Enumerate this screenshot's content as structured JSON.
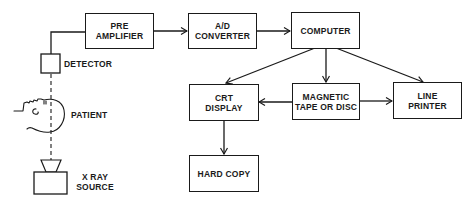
{
  "diagram": {
    "type": "block-diagram",
    "components": {
      "preamp": {
        "lines": [
          "PRE",
          "AMPLIFIER"
        ]
      },
      "adc": {
        "lines": [
          "A/D",
          "CONVERTER"
        ]
      },
      "computer": {
        "lines": [
          "COMPUTER"
        ]
      },
      "crt": {
        "lines": [
          "CRT",
          "DISPLAY"
        ]
      },
      "magnetic": {
        "lines": [
          "MAGNETIC",
          "TAPE OR DISC"
        ]
      },
      "printer": {
        "lines": [
          "LINE",
          "PRINTER"
        ]
      },
      "hardcopy": {
        "lines": [
          "HARD COPY"
        ]
      }
    },
    "labels": {
      "detector": "DETECTOR",
      "patient": "PATIENT",
      "xray_line1": "X RAY",
      "xray_line2": "SOURCE"
    },
    "connections": [
      {
        "from": "detector",
        "to": "preamp",
        "style": "solid"
      },
      {
        "from": "preamp",
        "to": "adc",
        "style": "arrow"
      },
      {
        "from": "adc",
        "to": "computer",
        "style": "arrow"
      },
      {
        "from": "computer",
        "to": "crt",
        "style": "arrow"
      },
      {
        "from": "computer",
        "to": "magnetic",
        "style": "arrow"
      },
      {
        "from": "computer",
        "to": "printer",
        "style": "arrow"
      },
      {
        "from": "magnetic",
        "to": "crt",
        "style": "arrow"
      },
      {
        "from": "magnetic",
        "to": "printer",
        "style": "arrow"
      },
      {
        "from": "crt",
        "to": "hardcopy",
        "style": "arrow"
      },
      {
        "from": "xray_source",
        "to": "detector",
        "style": "dashed",
        "through": "patient"
      }
    ],
    "colors": {
      "stroke": "#1a1a1a",
      "background": "#ffffff"
    }
  }
}
